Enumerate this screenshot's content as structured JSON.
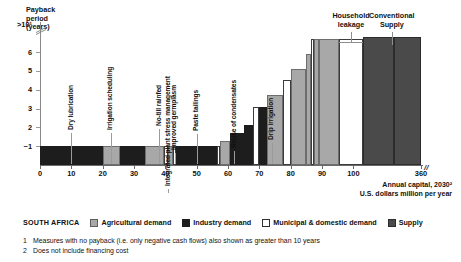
{
  "chart_data": {
    "type": "bar",
    "title": "",
    "subtitle": "",
    "region": "SOUTH AFRICA",
    "ylabel": "Payback\nperiod\n(years)",
    "xlabel": "Annual capital, 2030²\nU.S. dollars million per year",
    "ytick_labels": [
      ">10¹",
      "6",
      "5",
      "4",
      "3",
      "2",
      "~1"
    ],
    "xtick_labels": [
      "0",
      "10",
      "20",
      "30",
      "40",
      "50",
      "60",
      "70",
      "80",
      "90",
      "100",
      "360"
    ],
    "xlim": [
      0,
      360
    ],
    "ylim": [
      0,
      10
    ],
    "grid": false,
    "axis_break_x": "//",
    "axis_break_y": "=",
    "legend_position": "bottom",
    "legend": [
      {
        "label": "Agricultural demand",
        "color": "#a8a8a8",
        "key": "ag"
      },
      {
        "label": "Industry demand",
        "color": "#1d1d1d",
        "key": "ind"
      },
      {
        "label": "Municipal & domestic demand",
        "color": "#ffffff",
        "key": "mun"
      },
      {
        "label": "Supply",
        "color": "#4a4a4a",
        "key": "sup"
      }
    ],
    "notes": [
      {
        "marker": "1",
        "text": "Measures with no payback (i.e. only negative cash flows) also shown as greater than 10 years"
      },
      {
        "marker": "2",
        "text": "Does not include financing cost"
      }
    ],
    "bars": [
      {
        "x0": 0,
        "x1": 20,
        "y": 1,
        "series": "ind"
      },
      {
        "x0": 20,
        "x1": 25.5,
        "y": 1,
        "series": "ag"
      },
      {
        "x0": 25.5,
        "x1": 33.5,
        "y": 1,
        "series": "ind"
      },
      {
        "x0": 33.5,
        "x1": 39.5,
        "y": 1,
        "series": "ag"
      },
      {
        "x0": 39.5,
        "x1": 41,
        "y": 1,
        "series": "mun"
      },
      {
        "x0": 41,
        "x1": 42.5,
        "y": 1,
        "series": "ag"
      },
      {
        "x0": 42.5,
        "x1": 43.5,
        "y": 1,
        "series": "mun"
      },
      {
        "x0": 43.5,
        "x1": 56.5,
        "y": 1,
        "series": "ind"
      },
      {
        "x0": 56.5,
        "x1": 57.5,
        "y": 1,
        "series": "mun"
      },
      {
        "x0": 57.5,
        "x1": 60.5,
        "y": 1.3,
        "series": "ag"
      },
      {
        "x0": 60.5,
        "x1": 65,
        "y": 1.7,
        "series": "ind"
      },
      {
        "x0": 65,
        "x1": 68,
        "y": 2.1,
        "series": "ind"
      },
      {
        "x0": 68,
        "x1": 70,
        "y": 3.1,
        "series": "mun"
      },
      {
        "x0": 70,
        "x1": 72.5,
        "y": 3.1,
        "series": "ind"
      },
      {
        "x0": 72.5,
        "x1": 77.5,
        "y": 3.7,
        "series": "ag"
      },
      {
        "x0": 77.5,
        "x1": 80,
        "y": 4.5,
        "series": "mun"
      },
      {
        "x0": 80,
        "x1": 85,
        "y": 5.1,
        "series": "ag"
      },
      {
        "x0": 85,
        "x1": 86.5,
        "y": 5.9,
        "series": "ag"
      },
      {
        "x0": 86.5,
        "x1": 87.5,
        "y": 6.7,
        "series": "mun"
      },
      {
        "x0": 87.5,
        "x1": 89,
        "y": 6.7,
        "series": "ag"
      },
      {
        "x0": 89,
        "x1": 95.5,
        "y": 6.7,
        "series": "ag"
      },
      {
        "x0": 95.5,
        "x1": 103,
        "y": 6.7,
        "series": "mun"
      },
      {
        "x0": 103,
        "x1": 230,
        "y": 6.8,
        "series": "sup"
      },
      {
        "x0": 230,
        "x1": 360,
        "y": 6.8,
        "series": "sup"
      }
    ],
    "callouts_vertical": [
      {
        "label": "Dry lubrication",
        "x": 10
      },
      {
        "label": "Irrigation scheduling",
        "x": 22.5
      },
      {
        "label": "No-till rainfed",
        "x": 38
      },
      {
        "label": "Integrated plant stress management",
        "x": 41
      },
      {
        "label": "Improved germplasm",
        "x": 43
      },
      {
        "label": "Paste tailings",
        "x": 50
      },
      {
        "label": "Reuse of condensates",
        "x": 62
      },
      {
        "label": "Drip irrigation",
        "x": 74
      }
    ],
    "callouts_top": [
      {
        "label": "Household\nleakage",
        "x0": 95.5,
        "x1": 103
      },
      {
        "label": "Conventional\nSupply",
        "x0": 103,
        "x1": 360
      }
    ]
  }
}
